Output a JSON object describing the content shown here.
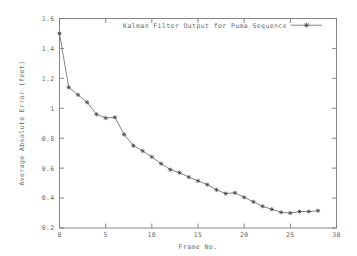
{
  "chart_data": {
    "type": "line",
    "title": "",
    "xlabel": "Frame No.",
    "ylabel": "Average Absolute Error (feet)",
    "xlim": [
      0,
      30
    ],
    "ylim": [
      0.2,
      1.6
    ],
    "xticks": [
      "0",
      "5",
      "10",
      "15",
      "20",
      "25",
      "30"
    ],
    "xtick_values": [
      0,
      5,
      10,
      15,
      20,
      25,
      30
    ],
    "yticks": [
      "0.2",
      "0.4",
      "0.6",
      "0.8",
      "1",
      "1.2",
      "1.4",
      "1.6"
    ],
    "ytick_values": [
      0.2,
      0.4,
      0.6,
      0.8,
      1.0,
      1.2,
      1.4,
      1.6
    ],
    "grid": false,
    "legend_position": "top-right",
    "series": [
      {
        "name": "Kalman Filter Output for Puma Sequence",
        "color": "#6e6e6e",
        "marker": "plus-cross",
        "x": [
          0,
          1,
          2,
          3,
          4,
          5,
          6,
          7,
          8,
          9,
          10,
          11,
          12,
          13,
          14,
          15,
          16,
          17,
          18,
          19,
          20,
          21,
          22,
          23,
          24,
          25,
          26,
          27,
          28
        ],
        "values": [
          1.5,
          1.14,
          1.09,
          1.04,
          0.96,
          0.935,
          0.94,
          0.825,
          0.75,
          0.715,
          0.675,
          0.63,
          0.59,
          0.57,
          0.54,
          0.515,
          0.49,
          0.455,
          0.43,
          0.435,
          0.405,
          0.375,
          0.345,
          0.325,
          0.305,
          0.3,
          0.31,
          0.31,
          0.315
        ]
      }
    ]
  },
  "legend": {
    "entries": [
      {
        "label": "Kalman Filter Output for Puma Sequence"
      }
    ]
  },
  "axes": {
    "x_title": "Frame No.",
    "y_title": "Average Absolute Error (feet)"
  }
}
